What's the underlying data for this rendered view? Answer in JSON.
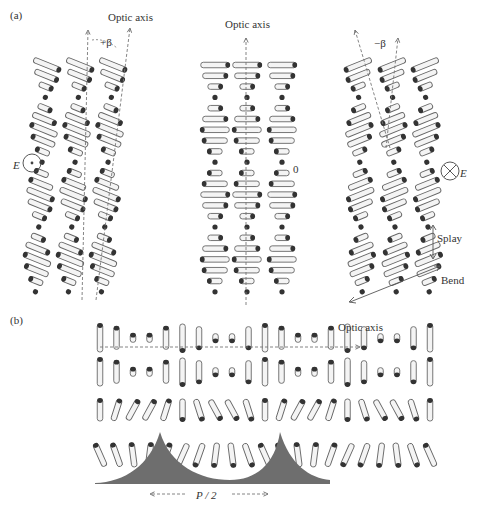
{
  "figure": {
    "panel_a_label": "(a)",
    "panel_b_label": "(b)",
    "panel_a": {
      "left": {
        "optic_axis_label": "Optic axis",
        "angle_label": "+β",
        "field_label": "E",
        "field_symbol": "dot-in-circle (out of page)",
        "tilt_deg": 18
      },
      "middle": {
        "optic_axis_label": "Optic axis",
        "angle_label": "0",
        "tilt_deg": 0
      },
      "right": {
        "angle_label": "−β",
        "field_label": "E",
        "field_symbol": "cross-in-circle (into page)",
        "tilt_deg": -18,
        "splay_label": "Splay",
        "bend_label": "Bend"
      }
    },
    "panel_b": {
      "optic_axis_label": "Optic axis",
      "period_label": "P / 2"
    },
    "colors": {
      "rod_outline": "#666666",
      "rod_fill": "#f4f4f4",
      "rod_end": "#333333",
      "axis_dash": "#777777",
      "surface": "#6e6e6e",
      "text": "#333333"
    }
  }
}
